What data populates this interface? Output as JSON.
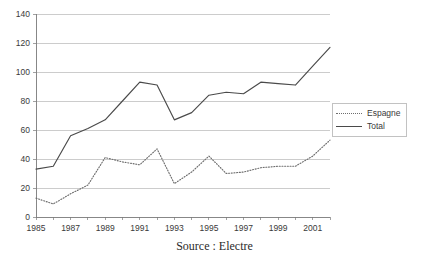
{
  "chart_data": {
    "type": "line",
    "title": "",
    "subtitle": "",
    "xlabel": "",
    "ylabel": "",
    "xlim": [
      1985,
      2002
    ],
    "ylim": [
      0,
      140
    ],
    "ytick_step": 20,
    "grid": true,
    "legend_position": "right",
    "x": [
      1985,
      1986,
      1987,
      1988,
      1989,
      1990,
      1991,
      1992,
      1993,
      1994,
      1995,
      1996,
      1997,
      1998,
      1999,
      2000,
      2001,
      2002
    ],
    "x_tick_labels": [
      "1985",
      "1987",
      "1989",
      "1991",
      "1993",
      "1995",
      "1997",
      "1999",
      "2001"
    ],
    "y_tick_labels": [
      "0",
      "20",
      "40",
      "60",
      "80",
      "100",
      "120",
      "140"
    ],
    "series": [
      {
        "name": "Espagne",
        "style": "dotted",
        "color": "#6e6e6e",
        "values": [
          13,
          9,
          16,
          22,
          41,
          38,
          36,
          47,
          23,
          31,
          42,
          30,
          31,
          34,
          35,
          35,
          42,
          53
        ]
      },
      {
        "name": "Total",
        "style": "solid",
        "color": "#4a4a4a",
        "values": [
          33,
          35,
          56,
          61,
          67,
          80,
          93,
          91,
          67,
          72,
          84,
          86,
          85,
          93,
          92,
          91,
          104,
          117
        ]
      }
    ],
    "annotations": []
  },
  "legend": {
    "items": [
      {
        "label": "Espagne"
      },
      {
        "label": "Total"
      }
    ]
  },
  "caption": {
    "text": "Source : Electre"
  }
}
